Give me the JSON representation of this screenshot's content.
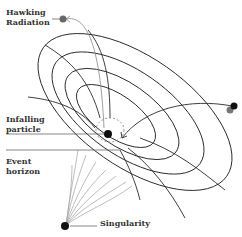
{
  "diagram": {
    "labels": {
      "hawking_radiation": [
        "Hawking",
        "Radiation"
      ],
      "infalling_particle": [
        "Infalling",
        "particle"
      ],
      "event_horizon": [
        "Event",
        "horizon"
      ],
      "singularity": "Singularity"
    },
    "colors": {
      "grid_line": "#2a2a2a",
      "gray_line": "#9a9a9a",
      "particle_dark": "#111111",
      "particle_gray": "#666666",
      "text": "#333333"
    },
    "icons": {
      "hawking_particle": "gray-dot",
      "infalling_particle": "black-dot",
      "orbiting_particle": "black-gray-double-dot",
      "singularity_point": "black-dot"
    }
  }
}
